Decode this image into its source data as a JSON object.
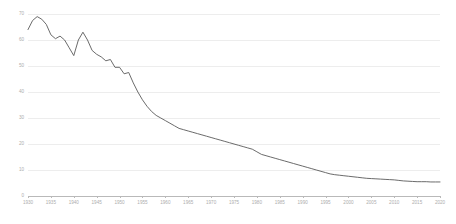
{
  "chart_data": {
    "type": "line",
    "title": "",
    "subtitle": "",
    "xlabel": "",
    "ylabel": "",
    "xlim": [
      1930,
      2020
    ],
    "ylim": [
      0,
      70
    ],
    "grid": true,
    "legend_position": "none",
    "line_color": "#5a5a5a",
    "grid_color": "#ededed",
    "axis_color": "#b9b9b9",
    "tick_label_color": "#adadad",
    "y_ticks": [
      0,
      10,
      20,
      30,
      40,
      50,
      60,
      70
    ],
    "y_tick_labels": [
      "0",
      "10",
      "20",
      "30",
      "40",
      "50",
      "60",
      "70"
    ],
    "x_ticks": [
      1930,
      1935,
      1940,
      1945,
      1950,
      1955,
      1960,
      1965,
      1970,
      1975,
      1980,
      1985,
      1990,
      1995,
      2000,
      2005,
      2010,
      2015,
      2020
    ],
    "x_tick_labels": [
      "1930",
      "1935",
      "1940",
      "1945",
      "1950",
      "1955",
      "1960",
      "1965",
      "1970",
      "1975",
      "1980",
      "1985",
      "1990",
      "1995",
      "2000",
      "2005",
      "2010",
      "2015",
      "2020"
    ],
    "series": [
      {
        "name": "rate",
        "x": [
          1930,
          1931,
          1932,
          1933,
          1934,
          1935,
          1936,
          1937,
          1938,
          1939,
          1940,
          1941,
          1942,
          1943,
          1944,
          1945,
          1946,
          1947,
          1948,
          1949,
          1950,
          1951,
          1952,
          1953,
          1954,
          1955,
          1956,
          1957,
          1958,
          1959,
          1960,
          1961,
          1962,
          1963,
          1964,
          1965,
          1966,
          1967,
          1968,
          1969,
          1970,
          1971,
          1972,
          1973,
          1974,
          1975,
          1976,
          1977,
          1978,
          1979,
          1980,
          1981,
          1982,
          1983,
          1984,
          1985,
          1986,
          1987,
          1988,
          1989,
          1990,
          1991,
          1992,
          1993,
          1994,
          1995,
          1996,
          1997,
          1998,
          1999,
          2000,
          2001,
          2002,
          2003,
          2004,
          2005,
          2006,
          2007,
          2008,
          2009,
          2010,
          2011,
          2012,
          2013,
          2014,
          2015,
          2016,
          2017,
          2018,
          2019,
          2020
        ],
        "values": [
          64.0,
          67.5,
          69.0,
          68.0,
          66.0,
          62.0,
          60.5,
          61.5,
          60.0,
          57.0,
          54.0,
          60.0,
          63.0,
          60.0,
          56.0,
          54.5,
          53.5,
          52.0,
          52.5,
          49.5,
          49.5,
          47.0,
          47.5,
          43.5,
          40.0,
          37.0,
          34.5,
          32.5,
          31.0,
          30.0,
          29.0,
          28.0,
          27.0,
          26.0,
          25.5,
          25.0,
          24.5,
          24.0,
          23.5,
          23.0,
          22.5,
          22.0,
          21.5,
          21.0,
          20.5,
          20.0,
          19.5,
          19.0,
          18.5,
          18.0,
          17.0,
          16.0,
          15.5,
          15.0,
          14.5,
          14.0,
          13.5,
          13.0,
          12.5,
          12.0,
          11.5,
          11.0,
          10.5,
          10.0,
          9.5,
          9.0,
          8.5,
          8.2,
          8.0,
          7.8,
          7.6,
          7.4,
          7.2,
          7.0,
          6.8,
          6.7,
          6.6,
          6.5,
          6.4,
          6.3,
          6.2,
          6.0,
          5.8,
          5.7,
          5.6,
          5.5,
          5.5,
          5.5,
          5.4,
          5.4,
          5.4
        ]
      }
    ]
  }
}
